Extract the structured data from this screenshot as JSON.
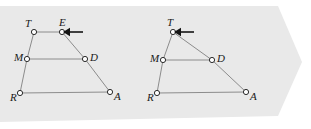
{
  "canvas": {
    "width": 311,
    "height": 129,
    "background": "#ffffff"
  },
  "banner": {
    "name": "banner-background",
    "fill": "#e9e9e9",
    "points": "0,6 278,6 302,62 278,116 0,122"
  },
  "figures": [
    {
      "id": "left",
      "name": "figure-trapezoid-tmrad",
      "shape_type": "trapezoid",
      "arrow": {
        "direction": "left",
        "target_label": "E",
        "x": 63,
        "y": 32
      },
      "vertices": [
        {
          "label": "T",
          "x": 34,
          "y": 32,
          "label_dx": -9,
          "label_dy": -5
        },
        {
          "label": "E",
          "x": 62,
          "y": 32,
          "label_dx": -3,
          "label_dy": -6
        },
        {
          "label": "D",
          "x": 85,
          "y": 59,
          "label_dx": 5,
          "label_dy": 2
        },
        {
          "label": "A",
          "x": 110,
          "y": 92,
          "label_dx": 4,
          "label_dy": 8
        },
        {
          "label": "R",
          "x": 20,
          "y": 93,
          "label_dx": -10,
          "label_dy": 8
        },
        {
          "label": "M",
          "x": 27,
          "y": 59,
          "label_dx": -13,
          "label_dy": 2
        }
      ],
      "edges": [
        {
          "from": "T",
          "to": "E"
        },
        {
          "from": "E",
          "to": "D"
        },
        {
          "from": "D",
          "to": "A"
        },
        {
          "from": "A",
          "to": "R"
        },
        {
          "from": "R",
          "to": "M"
        },
        {
          "from": "M",
          "to": "T"
        },
        {
          "from": "M",
          "to": "D"
        }
      ]
    },
    {
      "id": "right",
      "name": "figure-triangle-tmrad",
      "shape_type": "triangle",
      "arrow": {
        "direction": "left",
        "target_label": "T",
        "x": 174,
        "y": 32
      },
      "vertices": [
        {
          "label": "T",
          "x": 173,
          "y": 32,
          "label_dx": -6,
          "label_dy": -6
        },
        {
          "label": "D",
          "x": 212,
          "y": 60,
          "label_dx": 5,
          "label_dy": 2
        },
        {
          "label": "A",
          "x": 246,
          "y": 92,
          "label_dx": 4,
          "label_dy": 8
        },
        {
          "label": "R",
          "x": 157,
          "y": 93,
          "label_dx": -10,
          "label_dy": 8
        },
        {
          "label": "M",
          "x": 163,
          "y": 60,
          "label_dx": -13,
          "label_dy": 2
        }
      ],
      "edges": [
        {
          "from": "T",
          "to": "D"
        },
        {
          "from": "D",
          "to": "A"
        },
        {
          "from": "A",
          "to": "R"
        },
        {
          "from": "R",
          "to": "M"
        },
        {
          "from": "M",
          "to": "T"
        },
        {
          "from": "M",
          "to": "D"
        }
      ]
    }
  ],
  "style": {
    "line_color": "#8c8c8c",
    "node_fill": "#ffffff",
    "node_stroke": "#2b2b2b",
    "node_radius": 2.6,
    "label_color": "#1a1a1a",
    "arrow_color": "#141414"
  }
}
